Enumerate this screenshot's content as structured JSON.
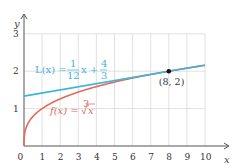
{
  "chart_data": {
    "type": "line",
    "title": "",
    "xlabel": "x",
    "ylabel": "y",
    "xlim": [
      0,
      10
    ],
    "ylim": [
      0,
      3
    ],
    "grid": true,
    "x_ticks": [
      "0",
      "1",
      "2",
      "3",
      "4",
      "5",
      "6",
      "7",
      "8",
      "9",
      "10"
    ],
    "y_ticks": [
      "1",
      "2",
      "3"
    ],
    "series": [
      {
        "name": "f(x) = ∛x",
        "color": "#e36a5a",
        "function": "cbrt(x)",
        "x": [
          0,
          0.125,
          1,
          2,
          3,
          4,
          5,
          6,
          7,
          8,
          9,
          10
        ],
        "values": [
          0,
          0.5,
          1,
          1.26,
          1.442,
          1.587,
          1.71,
          1.817,
          1.913,
          2,
          2.08,
          2.154
        ]
      },
      {
        "name": "L(x) = (1/12)x + 4/3",
        "color": "#3fb4d8",
        "function": "x/12 + 4/3",
        "x": [
          0,
          10
        ],
        "values": [
          1.3333,
          2.1667
        ]
      }
    ],
    "annotations": [
      {
        "text": "(8, 2)",
        "x": 8,
        "y": 2,
        "marker": "point"
      }
    ]
  },
  "labels": {
    "L_name": "L(x) =",
    "L_frac_num": "1",
    "L_frac_den": "12",
    "L_mid": "x +",
    "L_frac2_num": "4",
    "L_frac2_den": "3",
    "f_name": "f(x) =",
    "f_root_index": "3",
    "f_radicand": "x",
    "point": "(8, 2)",
    "x_axis": "x",
    "y_axis": "y"
  },
  "colors": {
    "grid": "#d9d9d9",
    "axis": "#555555",
    "linear": "#3fb4d8",
    "cuberoot": "#e36a5a",
    "point": "#111111"
  }
}
